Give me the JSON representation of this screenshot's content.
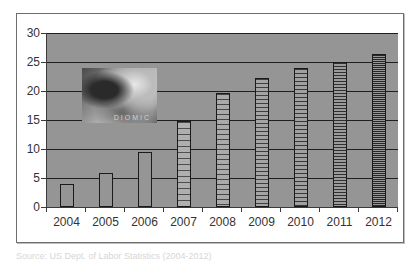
{
  "chart_data": {
    "type": "bar",
    "title": "",
    "xlabel": "",
    "ylabel": "",
    "categories": [
      "2004",
      "2005",
      "2006",
      "2007",
      "2008",
      "2009",
      "2010",
      "2011",
      "2012"
    ],
    "values": [
      3.9,
      5.9,
      9.5,
      14.8,
      19.6,
      22.2,
      24.0,
      25.0,
      26.4
    ],
    "ylim": [
      0,
      30
    ],
    "yticks": [
      0,
      5,
      10,
      15,
      20,
      25,
      30
    ],
    "grid": true,
    "legend": null,
    "plot_background": "#959595",
    "annotation": "embedded grayscale photo in upper-left of plot area"
  },
  "yaxis": {
    "labels": [
      "30",
      "25",
      "20",
      "15",
      "10",
      "5",
      "0"
    ]
  },
  "xaxis": {
    "labels": [
      "2004",
      "2005",
      "2006",
      "2007",
      "2008",
      "2009",
      "2010",
      "2011",
      "2012"
    ]
  },
  "photo": {
    "caption_text": "DIOMIC"
  },
  "caption": "Source: US Dept. of Labor Statistics  (2004-2012)"
}
